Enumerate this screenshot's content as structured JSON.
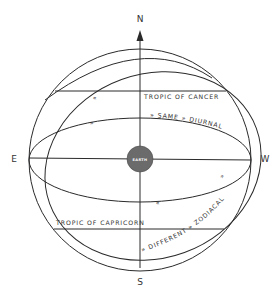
{
  "diagram": {
    "cardinals": {
      "north": "N",
      "south": "S",
      "east": "E",
      "west": "W"
    },
    "center_label": "EARTH",
    "labels": {
      "tropic_cancer": "TROPIC OF CANCER",
      "tropic_capricorn": "TROPIC OF CAPRICORN",
      "upper_path": "» SAME » DIURNAL »",
      "lower_path": "» DIFFERENT » ZODIACAL »"
    },
    "markers": {
      "arrow_cancer": "«",
      "arrow_equator_back": "»",
      "arrow_equator_front": "«",
      "arrow_ecliptic": "»"
    },
    "colors": {
      "line": "#2a2a2a",
      "earth_fill": "#6b6b6b",
      "text": "#333333",
      "background": "#ffffff"
    }
  }
}
